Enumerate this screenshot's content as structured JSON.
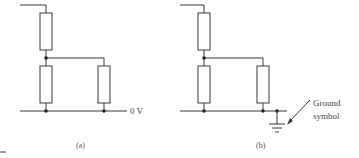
{
  "diagram": {
    "panel_a": {
      "caption": "(a)",
      "rail_label": "0 V"
    },
    "panel_b": {
      "caption": "(b)",
      "ground_label_line1": "Ground",
      "ground_label_line2": "symbol"
    },
    "colors": {
      "line": "#3a3a3a",
      "text": "#444444",
      "background": "#ffffff"
    }
  }
}
